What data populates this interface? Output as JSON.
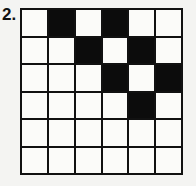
{
  "problem": {
    "number_label": "2.",
    "grid": {
      "rows": 6,
      "cols": 6,
      "filled_cells": [
        [
          0,
          1
        ],
        [
          0,
          3
        ],
        [
          1,
          2
        ],
        [
          1,
          4
        ],
        [
          2,
          3
        ],
        [
          2,
          5
        ],
        [
          3,
          4
        ]
      ]
    }
  }
}
